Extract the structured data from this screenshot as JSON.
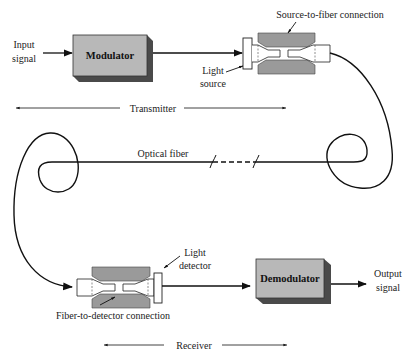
{
  "diagram": {
    "type": "fiber-optic-communication-system",
    "transmitter": {
      "input_label_line1": "Input",
      "input_label_line2": "signal",
      "modulator_label": "Modulator",
      "light_source_line1": "Light",
      "light_source_line2": "source",
      "connection_label": "Source-to-fiber connection",
      "section_label": "Transmitter"
    },
    "fiber": {
      "label": "Optical fiber"
    },
    "receiver": {
      "light_detector_line1": "Light",
      "light_detector_line2": "detector",
      "connection_label": "Fiber-to-detector connection",
      "demodulator_label": "Demodulator",
      "output_label_line1": "Output",
      "output_label_line2": "signal",
      "section_label": "Receiver"
    },
    "colors": {
      "box_face": "#b8b8b8",
      "box_shadow": "#555555",
      "connector_body": "#9a9a9a",
      "line": "#111111"
    }
  }
}
